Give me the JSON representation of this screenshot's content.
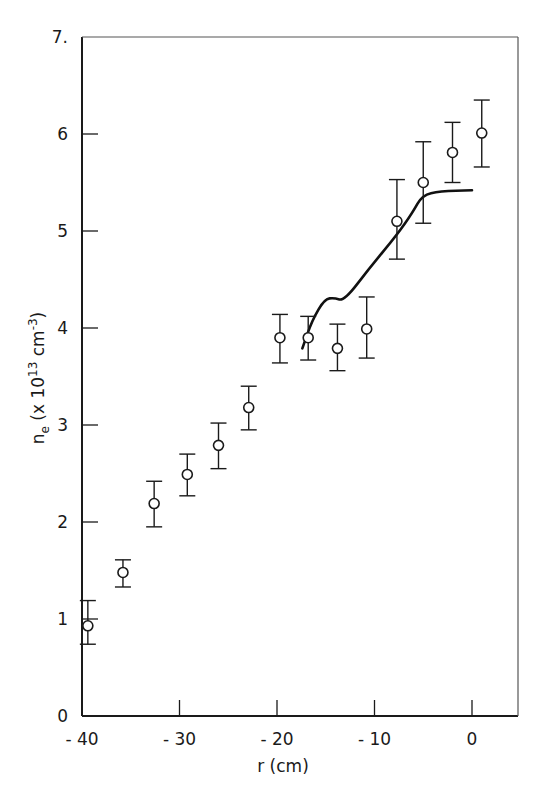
{
  "chart_data": {
    "type": "scatter",
    "title": "",
    "xlabel": "r (cm)",
    "ylabel": "n_e (x 10^13 cm^-3)",
    "ylabel_parts": {
      "main": "n",
      "sub": "e",
      "pre": "(x 10",
      "exp": "13",
      "mid": " cm",
      "exp2": "-3",
      "post": ")"
    },
    "xlim": [
      -40,
      5
    ],
    "ylim": [
      0,
      7
    ],
    "grid": false,
    "legend": null,
    "x_ticks": [
      -40,
      -30,
      -20,
      -10,
      0
    ],
    "x_tick_labels": [
      "-40",
      "-30",
      "-20",
      "-10",
      "0"
    ],
    "y_ticks": [
      0,
      1,
      2,
      3,
      4,
      5,
      6,
      7
    ],
    "y_tick_labels": [
      "0",
      "1",
      "2",
      "3",
      "4",
      "5",
      "6",
      "7."
    ],
    "series": [
      {
        "name": "measured",
        "kind": "scatter_errorbar",
        "marker": "open-circle",
        "points": [
          {
            "x": -39.4,
            "y": 0.93,
            "ylo": 0.74,
            "yhi": 1.19
          },
          {
            "x": -35.8,
            "y": 1.48,
            "ylo": 1.33,
            "yhi": 1.61
          },
          {
            "x": -32.6,
            "y": 2.19,
            "ylo": 1.95,
            "yhi": 2.42
          },
          {
            "x": -29.2,
            "y": 2.49,
            "ylo": 2.27,
            "yhi": 2.7
          },
          {
            "x": -26.0,
            "y": 2.79,
            "ylo": 2.55,
            "yhi": 3.02
          },
          {
            "x": -22.9,
            "y": 3.18,
            "ylo": 2.95,
            "yhi": 3.4
          },
          {
            "x": -19.7,
            "y": 3.9,
            "ylo": 3.64,
            "yhi": 4.14
          },
          {
            "x": -16.8,
            "y": 3.9,
            "ylo": 3.67,
            "yhi": 4.12
          },
          {
            "x": -13.8,
            "y": 3.79,
            "ylo": 3.56,
            "yhi": 4.04
          },
          {
            "x": -10.8,
            "y": 3.99,
            "ylo": 3.69,
            "yhi": 4.32
          },
          {
            "x": -7.7,
            "y": 5.1,
            "ylo": 4.71,
            "yhi": 5.53
          },
          {
            "x": -5.0,
            "y": 5.5,
            "ylo": 5.08,
            "yhi": 5.92
          },
          {
            "x": -2.0,
            "y": 5.81,
            "ylo": 5.5,
            "yhi": 6.12
          },
          {
            "x": 1.0,
            "y": 6.01,
            "ylo": 5.66,
            "yhi": 6.35
          }
        ]
      },
      {
        "name": "curve",
        "kind": "line",
        "points": [
          {
            "x": -17.4,
            "y": 3.79
          },
          {
            "x": -16.4,
            "y": 4.08
          },
          {
            "x": -15.1,
            "y": 4.3
          },
          {
            "x": -14.1,
            "y": 4.31
          },
          {
            "x": -13.1,
            "y": 4.28
          },
          {
            "x": -10.5,
            "y": 4.62
          },
          {
            "x": -7.7,
            "y": 4.96
          },
          {
            "x": -6.1,
            "y": 5.19
          },
          {
            "x": -5.1,
            "y": 5.37
          },
          {
            "x": -3.3,
            "y": 5.41
          },
          {
            "x": 0.0,
            "y": 5.42
          }
        ]
      }
    ]
  }
}
